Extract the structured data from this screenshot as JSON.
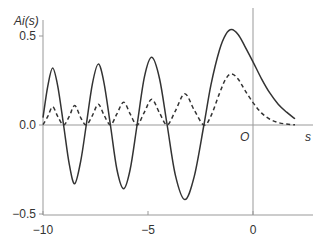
{
  "chart_data": {
    "type": "line",
    "title": "",
    "xlabel": "s",
    "ylabel": "Ai(s)",
    "origin_label": "O",
    "xlim": [
      -10,
      2.8
    ],
    "ylim": [
      -0.5,
      0.62
    ],
    "x_ticks": [
      {
        "v": -10,
        "label": "−10"
      },
      {
        "v": -5,
        "label": "−5"
      },
      {
        "v": 0,
        "label": "0"
      }
    ],
    "y_ticks": [
      {
        "v": 0.5,
        "label": "0.5"
      },
      {
        "v": 0.0,
        "label": "0.0"
      },
      {
        "v": -0.5,
        "label": "−0.5"
      }
    ],
    "grid": false,
    "series": [
      {
        "name": "Ai(s)",
        "style": "solid",
        "x": [
          -10,
          -9.77,
          -9.54,
          -9.3,
          -9.02,
          -8.75,
          -8.49,
          -8.2,
          -7.94,
          -7.65,
          -7.37,
          -7.1,
          -6.79,
          -6.48,
          -6.16,
          -5.85,
          -5.52,
          -5.17,
          -4.82,
          -4.45,
          -4.088,
          -3.7,
          -3.25,
          -2.8,
          -2.338,
          -2.0,
          -1.6,
          -1.3,
          -1.02,
          -0.7,
          -0.4,
          0,
          0.4,
          0.8,
          1.2,
          1.6,
          2.0
        ],
        "values": [
          0.042,
          0.22,
          0.32,
          0.22,
          0,
          -0.22,
          -0.33,
          -0.2,
          0,
          0.23,
          0.342,
          0.24,
          0,
          -0.25,
          -0.358,
          -0.25,
          0,
          0.27,
          0.38,
          0.26,
          0,
          -0.28,
          -0.419,
          -0.29,
          0,
          0.227,
          0.42,
          0.508,
          0.536,
          0.507,
          0.445,
          0.355,
          0.261,
          0.18,
          0.117,
          0.072,
          0.035
        ]
      }
    ],
    "derived_series": [
      {
        "name": "Ai(s)^2",
        "style": "dashed",
        "from": "Ai(s)",
        "op": "square"
      }
    ]
  }
}
